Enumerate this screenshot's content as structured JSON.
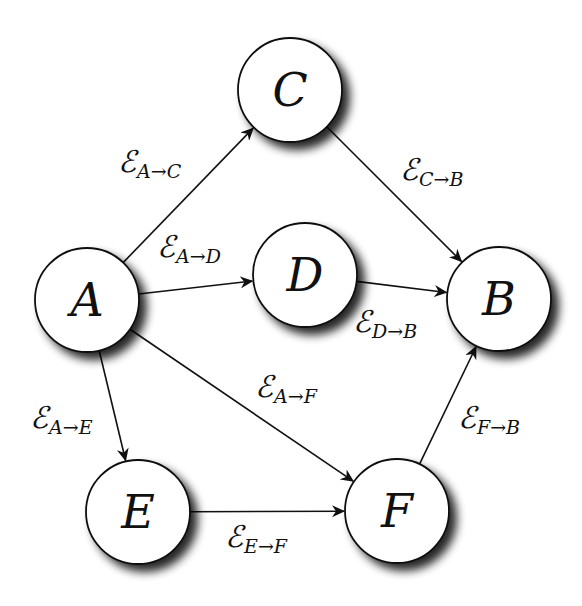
{
  "diagram": {
    "type": "directed-graph",
    "colors": {
      "node_fill": "#ffffff",
      "node_stroke": "#111111",
      "edge_stroke": "#111111",
      "shadow": "#000000"
    },
    "nodes": [
      {
        "id": "A",
        "label": "A",
        "cx": 87,
        "cy": 300,
        "r": 52
      },
      {
        "id": "B",
        "label": "B",
        "cx": 499,
        "cy": 299,
        "r": 52
      },
      {
        "id": "C",
        "label": "C",
        "cx": 290,
        "cy": 90,
        "r": 52
      },
      {
        "id": "D",
        "label": "D",
        "cx": 305,
        "cy": 275,
        "r": 52
      },
      {
        "id": "E",
        "label": "E",
        "cx": 138,
        "cy": 512,
        "r": 52
      },
      {
        "id": "F",
        "label": "F",
        "cx": 397,
        "cy": 511,
        "r": 52
      }
    ],
    "edges": [
      {
        "from": "A",
        "to": "C",
        "symbol": "ℰ",
        "sub_from": "A",
        "arrow": "→",
        "sub_to": "C",
        "label_x": 118,
        "label_y": 172
      },
      {
        "from": "C",
        "to": "B",
        "symbol": "ℰ",
        "sub_from": "C",
        "arrow": "→",
        "sub_to": "B",
        "label_x": 400,
        "label_y": 180
      },
      {
        "from": "A",
        "to": "D",
        "symbol": "ℰ",
        "sub_from": "A",
        "arrow": "→",
        "sub_to": "D",
        "label_x": 157,
        "label_y": 257
      },
      {
        "from": "D",
        "to": "B",
        "symbol": "ℰ",
        "sub_from": "D",
        "arrow": "→",
        "sub_to": "B",
        "label_x": 353,
        "label_y": 332
      },
      {
        "from": "A",
        "to": "F",
        "symbol": "ℰ",
        "sub_from": "A",
        "arrow": "→",
        "sub_to": "F",
        "label_x": 255,
        "label_y": 397
      },
      {
        "from": "A",
        "to": "E",
        "symbol": "ℰ",
        "sub_from": "A",
        "arrow": "→",
        "sub_to": "E",
        "label_x": 30,
        "label_y": 428
      },
      {
        "from": "F",
        "to": "B",
        "symbol": "ℰ",
        "sub_from": "F",
        "arrow": "→",
        "sub_to": "B",
        "label_x": 458,
        "label_y": 428
      },
      {
        "from": "E",
        "to": "F",
        "symbol": "ℰ",
        "sub_from": "E",
        "arrow": "→",
        "sub_to": "F",
        "label_x": 225,
        "label_y": 547
      }
    ]
  }
}
